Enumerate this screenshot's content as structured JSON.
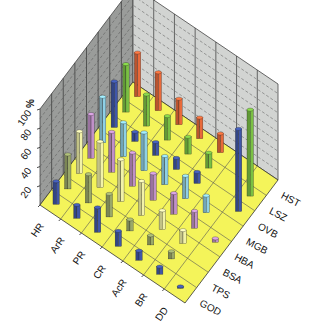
{
  "chart_data": {
    "type": "bar3d",
    "title": "",
    "zlabel": "%",
    "z_ticks": [
      20,
      40,
      60,
      80,
      100
    ],
    "zlim": [
      0,
      100
    ],
    "row_categories": [
      "HR",
      "ArR",
      "PR",
      "CR",
      "AcR",
      "BR",
      "DD"
    ],
    "column_categories": [
      "HST",
      "LSZ",
      "OVB",
      "MGB",
      "HBA",
      "BSA",
      "TPS",
      "GOD"
    ],
    "series": [
      {
        "name": "HST",
        "color": "#e8693a",
        "values": [
          46,
          40,
          27,
          22,
          20,
          0,
          0
        ]
      },
      {
        "name": "LSZ",
        "color": "#7ac043",
        "values": [
          50,
          33,
          25,
          18,
          16,
          0,
          90
        ]
      },
      {
        "name": "OVB",
        "color": "#3f56a8",
        "values": [
          48,
          10,
          14,
          12,
          12,
          0,
          86
        ]
      },
      {
        "name": "MGB",
        "color": "#8ed0e6",
        "values": [
          48,
          36,
          40,
          30,
          24,
          18,
          0
        ]
      },
      {
        "name": "HBA",
        "color": "#c090c8",
        "values": [
          46,
          42,
          35,
          28,
          22,
          18,
          4
        ]
      },
      {
        "name": "BSA",
        "color": "#f2f2a8",
        "values": [
          44,
          48,
          44,
          36,
          20,
          14,
          0
        ]
      },
      {
        "name": "TPS",
        "color": "#9aa86a",
        "values": [
          36,
          30,
          24,
          12,
          10,
          8,
          0
        ]
      },
      {
        "name": "GOD",
        "color": "#3f56a8",
        "values": [
          24,
          14,
          26,
          16,
          10,
          8,
          2
        ]
      }
    ],
    "colors": {
      "floor": "#f4f45a",
      "wall_left": "#9a9c9a",
      "wall_right": "#d2d4d2"
    },
    "grid": true
  }
}
